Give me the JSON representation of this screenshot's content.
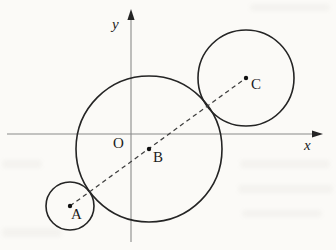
{
  "figure": {
    "colors": {
      "background": "#fbfaf7",
      "circle_stroke": "#242424",
      "axis_stroke": "#8a8a8a",
      "dashed_stroke": "#3f3f3f",
      "label_color": "#1c1c1c"
    },
    "labels": {
      "x_axis": "x",
      "y_axis": "y",
      "origin": "O",
      "point_a": "A",
      "point_b": "B",
      "point_c": "C"
    },
    "diagram": {
      "type": "geometry",
      "axes": {
        "x": {
          "from": [
            7,
            134
          ],
          "to": [
            315,
            134
          ],
          "arrow_tip": [
            323,
            134
          ],
          "label_pos": [
            304,
            150
          ]
        },
        "y": {
          "from": [
            131,
            17
          ],
          "to": [
            131,
            242
          ],
          "arrow_tip": [
            131,
            9
          ],
          "label_pos": [
            112,
            29
          ]
        }
      },
      "circles": [
        {
          "name": "circle-A",
          "center": [
            70,
            206
          ],
          "radius": 24
        },
        {
          "name": "circle-B",
          "center": [
            149,
            149
          ],
          "radius": 73
        },
        {
          "name": "circle-C",
          "center": [
            246,
            78
          ],
          "radius": 48
        }
      ],
      "dashed_line": {
        "from": [
          70,
          206
        ],
        "to": [
          246,
          78
        ]
      },
      "points": [
        {
          "name": "A",
          "dot": [
            70,
            206
          ],
          "label": "point_a",
          "label_pos": [
            71,
            219
          ]
        },
        {
          "name": "B",
          "dot": [
            149,
            149
          ],
          "label": "point_b",
          "label_pos": [
            153,
            162
          ]
        },
        {
          "name": "C",
          "dot": [
            246,
            78
          ],
          "label": "point_c",
          "label_pos": [
            251,
            89
          ]
        }
      ],
      "origin_label_pos": [
        113,
        148
      ]
    },
    "artifacts": [
      {
        "x": 250,
        "y": 4,
        "w": 80,
        "h": 7
      },
      {
        "x": 240,
        "y": 160,
        "w": 90,
        "h": 8
      },
      {
        "x": 238,
        "y": 185,
        "w": 95,
        "h": 8
      },
      {
        "x": 242,
        "y": 210,
        "w": 80,
        "h": 7
      },
      {
        "x": 2,
        "y": 160,
        "w": 40,
        "h": 8
      },
      {
        "x": 2,
        "y": 228,
        "w": 60,
        "h": 9
      }
    ]
  }
}
